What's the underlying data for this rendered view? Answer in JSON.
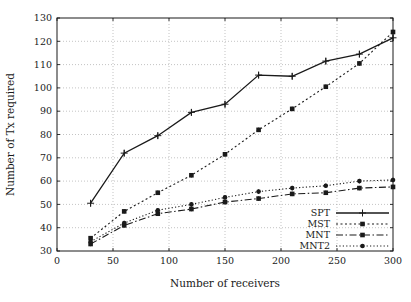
{
  "figure": {
    "background": "#ffffff",
    "ink_color": "#1a1a1a",
    "grid_color": "#aaaaaa"
  },
  "chart_data": {
    "type": "line",
    "title": "",
    "xlabel": "Number of receivers",
    "ylabel": "Number of Tx required",
    "xlim": [
      0,
      300
    ],
    "ylim": [
      30,
      130
    ],
    "x_ticks": [
      0,
      50,
      100,
      150,
      200,
      250,
      300
    ],
    "y_ticks": [
      30,
      40,
      50,
      60,
      70,
      80,
      90,
      100,
      110,
      120,
      130
    ],
    "grid": true,
    "legend_position": "bottom-right",
    "x": [
      30,
      60,
      90,
      120,
      150,
      180,
      210,
      240,
      270,
      300
    ],
    "series": [
      {
        "name": "SPT",
        "marker": "plus",
        "line": "solid",
        "color": "#1a1a1a",
        "values": [
          50.5,
          72,
          79.5,
          89.5,
          93,
          105.5,
          105,
          111.5,
          114.5,
          121.5
        ]
      },
      {
        "name": "MST",
        "marker": "square",
        "line": "dotted",
        "color": "#1a1a1a",
        "values": [
          35.5,
          47,
          55,
          62.5,
          71.5,
          82,
          91,
          100.5,
          110.5,
          124
        ]
      },
      {
        "name": "MNT",
        "marker": "square",
        "line": "dashdot",
        "color": "#1a1a1a",
        "values": [
          33,
          41,
          46,
          48,
          51,
          52.5,
          54.5,
          55,
          57,
          57.5
        ]
      },
      {
        "name": "MNT2",
        "marker": "circle",
        "line": "fine-dotted",
        "color": "#1a1a1a",
        "values": [
          34,
          42,
          47.5,
          50,
          53,
          55.5,
          57,
          58,
          60,
          60.5
        ]
      }
    ]
  }
}
